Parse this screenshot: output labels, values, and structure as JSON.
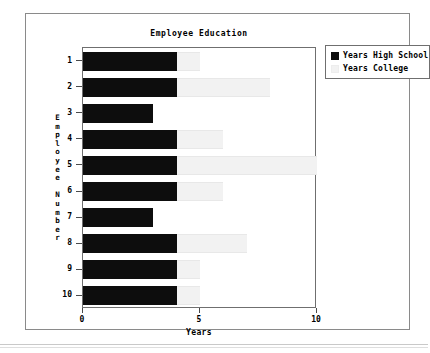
{
  "chart_data": {
    "type": "bar",
    "orientation": "horizontal",
    "stacked": true,
    "title": "Employee Education",
    "xlabel": "Years",
    "ylabel": "Employee Number",
    "xlim": [
      0,
      10
    ],
    "xticks": [
      "0",
      "5",
      "10"
    ],
    "xtick_values": [
      0,
      5,
      10
    ],
    "grid": false,
    "legend_position": "top-right",
    "categories": [
      "1",
      "2",
      "3",
      "4",
      "5",
      "6",
      "7",
      "8",
      "9",
      "10"
    ],
    "series": [
      {
        "name": "Years High School",
        "color": "#0d0d0d",
        "values": [
          4,
          4,
          3,
          4,
          4,
          4,
          3,
          4,
          4,
          4
        ]
      },
      {
        "name": "Years College",
        "color": "#f2f2f2",
        "values": [
          1,
          4,
          0,
          2,
          6,
          2,
          0,
          3,
          1,
          1
        ]
      }
    ]
  },
  "chart": {
    "title": "Employee Education",
    "x_axis_title": "Years",
    "y_axis_title_letters": [
      "E",
      "m",
      "p",
      "l",
      "o",
      "y",
      "e",
      "e",
      "",
      "N",
      "u",
      "m",
      "b",
      "e",
      "r"
    ],
    "x_tick_labels": [
      "0",
      "5",
      "10"
    ],
    "y_tick_labels": [
      "1",
      "2",
      "3",
      "4",
      "5",
      "6",
      "7",
      "8",
      "9",
      "10"
    ]
  },
  "legend": {
    "items": [
      {
        "label": "Years High School",
        "swatch": "legend-swatch-high-school"
      },
      {
        "label": "Years College",
        "swatch": "legend-swatch-college"
      }
    ]
  }
}
